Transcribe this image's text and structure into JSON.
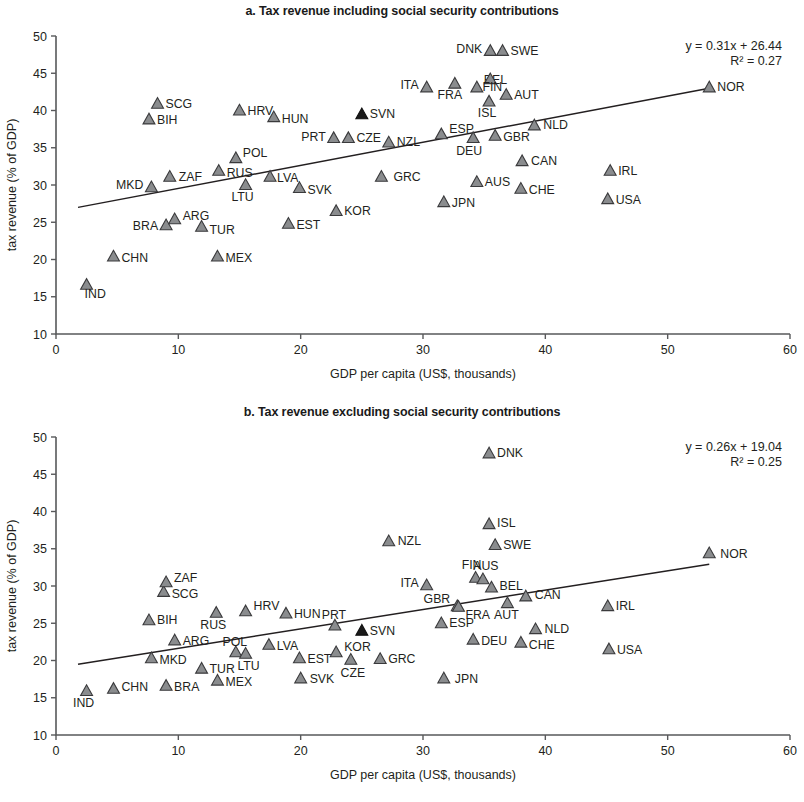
{
  "figure": {
    "width": 804,
    "height": 802,
    "background": "#ffffff",
    "marker_fill": "#8a8c8e",
    "marker_stroke": "#3a3a3c",
    "highlight_fill": "#1a1a1a",
    "axis_color": "#58595b",
    "trend_color": "#231f20"
  },
  "chart_data": [
    {
      "type": "scatter",
      "panel": "a",
      "title": "a. Tax revenue including social security contributions",
      "xlabel": "GDP per capita (US$, thousands)",
      "ylabel": "tax revenue (% of GDP)",
      "xlim": [
        0,
        60
      ],
      "ylim": [
        10,
        50
      ],
      "xticks": [
        0,
        10,
        20,
        30,
        40,
        50,
        60
      ],
      "yticks": [
        10,
        15,
        20,
        25,
        30,
        35,
        40,
        45,
        50
      ],
      "grid": false,
      "legend": "none",
      "annotations": {
        "equation": "y = 0.31x + 26.44",
        "r2": "R² = 0.27"
      },
      "trendline": {
        "slope": 0.31,
        "intercept": 26.44,
        "x_start": 1.8,
        "x_end": 53.4
      },
      "points": [
        {
          "label": "IND",
          "x": 2.5,
          "y": 16.6,
          "lx": -2,
          "ly": 13,
          "anchor": "start",
          "highlight": false
        },
        {
          "label": "CHN",
          "x": 4.7,
          "y": 20.4,
          "lx": 8,
          "ly": 5,
          "anchor": "start",
          "highlight": false
        },
        {
          "label": "BIH",
          "x": 7.6,
          "y": 38.8,
          "lx": 8,
          "ly": 5,
          "anchor": "start",
          "highlight": false
        },
        {
          "label": "SCG",
          "x": 8.3,
          "y": 40.9,
          "lx": 8,
          "ly": 4,
          "anchor": "start",
          "highlight": false
        },
        {
          "label": "MKD",
          "x": 7.8,
          "y": 29.7,
          "lx": -8,
          "ly": 2,
          "anchor": "end",
          "highlight": false
        },
        {
          "label": "BRA",
          "x": 9.0,
          "y": 24.6,
          "lx": -8,
          "ly": 5,
          "anchor": "end",
          "highlight": false
        },
        {
          "label": "ZAF",
          "x": 9.3,
          "y": 31.1,
          "lx": 9,
          "ly": 4,
          "anchor": "start",
          "highlight": false
        },
        {
          "label": "ARG",
          "x": 9.7,
          "y": 25.4,
          "lx": 8,
          "ly": 1,
          "anchor": "start",
          "highlight": false
        },
        {
          "label": "TUR",
          "x": 11.9,
          "y": 24.4,
          "lx": 8,
          "ly": 7,
          "anchor": "start",
          "highlight": false
        },
        {
          "label": "MEX",
          "x": 13.2,
          "y": 20.4,
          "lx": 8,
          "ly": 5,
          "anchor": "start",
          "highlight": false
        },
        {
          "label": "RUS",
          "x": 13.3,
          "y": 31.9,
          "lx": 8,
          "ly": 6,
          "anchor": "start",
          "highlight": false
        },
        {
          "label": "POL",
          "x": 14.7,
          "y": 33.6,
          "lx": 7,
          "ly": -1,
          "anchor": "start",
          "highlight": false
        },
        {
          "label": "LTU",
          "x": 15.5,
          "y": 30.0,
          "lx": -3,
          "ly": 16,
          "anchor": "middle",
          "highlight": false
        },
        {
          "label": "HRV",
          "x": 15.0,
          "y": 40.0,
          "lx": 8,
          "ly": 4,
          "anchor": "start",
          "highlight": false
        },
        {
          "label": "LVA",
          "x": 17.5,
          "y": 31.1,
          "lx": 7,
          "ly": 5,
          "anchor": "start",
          "highlight": false
        },
        {
          "label": "HUN",
          "x": 17.8,
          "y": 39.1,
          "lx": 8,
          "ly": 6,
          "anchor": "start",
          "highlight": false
        },
        {
          "label": "EST",
          "x": 19.0,
          "y": 24.8,
          "lx": 8,
          "ly": 5,
          "anchor": "start",
          "highlight": false
        },
        {
          "label": "SVK",
          "x": 19.9,
          "y": 29.6,
          "lx": 8,
          "ly": 6,
          "anchor": "start",
          "highlight": false
        },
        {
          "label": "PRT",
          "x": 22.7,
          "y": 36.3,
          "lx": -8,
          "ly": 3,
          "anchor": "end",
          "highlight": false
        },
        {
          "label": "CZE",
          "x": 23.9,
          "y": 36.3,
          "lx": 8,
          "ly": 4,
          "anchor": "start",
          "highlight": false
        },
        {
          "label": "KOR",
          "x": 22.9,
          "y": 26.5,
          "lx": 8,
          "ly": 4,
          "anchor": "start",
          "highlight": false
        },
        {
          "label": "SVN",
          "x": 25.0,
          "y": 39.5,
          "lx": 8,
          "ly": 4,
          "anchor": "start",
          "highlight": true
        },
        {
          "label": "GRC",
          "x": 26.6,
          "y": 31.1,
          "lx": 12,
          "ly": 4,
          "anchor": "start",
          "highlight": false
        },
        {
          "label": "NZL",
          "x": 27.2,
          "y": 35.7,
          "lx": 8,
          "ly": 3,
          "anchor": "start",
          "highlight": false
        },
        {
          "label": "ITA",
          "x": 30.3,
          "y": 43.1,
          "lx": -8,
          "ly": 2,
          "anchor": "end",
          "highlight": false
        },
        {
          "label": "ESP",
          "x": 31.5,
          "y": 36.8,
          "lx": 8,
          "ly": -1,
          "anchor": "start",
          "highlight": false
        },
        {
          "label": "JPN",
          "x": 31.7,
          "y": 27.7,
          "lx": 8,
          "ly": 5,
          "anchor": "start",
          "highlight": false
        },
        {
          "label": "FRA",
          "x": 32.6,
          "y": 43.6,
          "lx": -5,
          "ly": 15,
          "anchor": "middle",
          "highlight": false
        },
        {
          "label": "DEU",
          "x": 34.1,
          "y": 36.3,
          "lx": -4,
          "ly": 17,
          "anchor": "middle",
          "highlight": false
        },
        {
          "label": "AUS",
          "x": 34.4,
          "y": 30.4,
          "lx": 8,
          "ly": 4,
          "anchor": "start",
          "highlight": false
        },
        {
          "label": "BEL",
          "x": 34.4,
          "y": 43.1,
          "lx": 7,
          "ly": -3,
          "anchor": "start",
          "highlight": false
        },
        {
          "label": "DNK",
          "x": 35.5,
          "y": 48.0,
          "lx": -8,
          "ly": 2,
          "anchor": "end",
          "highlight": false
        },
        {
          "label": "FIN",
          "x": 35.5,
          "y": 44.2,
          "lx": 2,
          "ly": 12,
          "anchor": "middle",
          "highlight": false
        },
        {
          "label": "ISL",
          "x": 35.4,
          "y": 41.2,
          "lx": -2,
          "ly": 15,
          "anchor": "middle",
          "highlight": false
        },
        {
          "label": "GBR",
          "x": 35.9,
          "y": 36.6,
          "lx": 8,
          "ly": 5,
          "anchor": "start",
          "highlight": false
        },
        {
          "label": "SWE",
          "x": 36.5,
          "y": 48.0,
          "lx": 8,
          "ly": 4,
          "anchor": "start",
          "highlight": false
        },
        {
          "label": "AUT",
          "x": 36.8,
          "y": 42.1,
          "lx": 8,
          "ly": 4,
          "anchor": "start",
          "highlight": false
        },
        {
          "label": "CHE",
          "x": 38.0,
          "y": 29.5,
          "lx": 8,
          "ly": 5,
          "anchor": "start",
          "highlight": false
        },
        {
          "label": "CAN",
          "x": 38.1,
          "y": 33.2,
          "lx": 9,
          "ly": 4,
          "anchor": "start",
          "highlight": false
        },
        {
          "label": "NLD",
          "x": 39.1,
          "y": 38.0,
          "lx": 9,
          "ly": 4,
          "anchor": "start",
          "highlight": false
        },
        {
          "label": "USA",
          "x": 45.1,
          "y": 28.1,
          "lx": 8,
          "ly": 5,
          "anchor": "start",
          "highlight": false
        },
        {
          "label": "IRL",
          "x": 45.3,
          "y": 31.9,
          "lx": 8,
          "ly": 4,
          "anchor": "start",
          "highlight": false
        },
        {
          "label": "NOR",
          "x": 53.4,
          "y": 43.1,
          "lx": 8,
          "ly": 4,
          "anchor": "start",
          "highlight": false
        }
      ]
    },
    {
      "type": "scatter",
      "panel": "b",
      "title": "b. Tax revenue excluding social security contributions",
      "xlabel": "GDP per capita (US$, thousands)",
      "ylabel": "tax revenue (% of GDP)",
      "xlim": [
        0,
        60
      ],
      "ylim": [
        10,
        50
      ],
      "xticks": [
        0,
        10,
        20,
        30,
        40,
        50,
        60
      ],
      "yticks": [
        10,
        15,
        20,
        25,
        30,
        35,
        40,
        45,
        50
      ],
      "grid": false,
      "legend": "none",
      "annotations": {
        "equation": "y = 0.26x + 19.04",
        "r2": "R² = 0.25"
      },
      "trendline": {
        "slope": 0.26,
        "intercept": 19.04,
        "x_start": 1.8,
        "x_end": 53.4
      },
      "points": [
        {
          "label": "IND",
          "x": 2.5,
          "y": 15.9,
          "lx": -3,
          "ly": 16,
          "anchor": "middle",
          "highlight": false
        },
        {
          "label": "CHN",
          "x": 4.7,
          "y": 16.2,
          "lx": 8,
          "ly": 2,
          "anchor": "start",
          "highlight": false
        },
        {
          "label": "BRA",
          "x": 9.0,
          "y": 16.6,
          "lx": 8,
          "ly": 5,
          "anchor": "start",
          "highlight": false
        },
        {
          "label": "MKD",
          "x": 7.8,
          "y": 20.3,
          "lx": 8,
          "ly": 6,
          "anchor": "start",
          "highlight": false
        },
        {
          "label": "BIH",
          "x": 7.6,
          "y": 25.4,
          "lx": 8,
          "ly": 4,
          "anchor": "start",
          "highlight": false
        },
        {
          "label": "SCG",
          "x": 8.8,
          "y": 29.2,
          "lx": 8,
          "ly": 6,
          "anchor": "start",
          "highlight": false
        },
        {
          "label": "ZAF",
          "x": 9.0,
          "y": 30.5,
          "lx": 8,
          "ly": 0,
          "anchor": "start",
          "highlight": false
        },
        {
          "label": "ARG",
          "x": 9.7,
          "y": 22.7,
          "lx": 8,
          "ly": 5,
          "anchor": "start",
          "highlight": false
        },
        {
          "label": "TUR",
          "x": 11.9,
          "y": 18.9,
          "lx": 8,
          "ly": 4,
          "anchor": "start",
          "highlight": false
        },
        {
          "label": "RUS",
          "x": 13.1,
          "y": 26.4,
          "lx": -3,
          "ly": 16,
          "anchor": "middle",
          "highlight": false
        },
        {
          "label": "MEX",
          "x": 13.2,
          "y": 17.3,
          "lx": 8,
          "ly": 5,
          "anchor": "start",
          "highlight": false
        },
        {
          "label": "POL",
          "x": 14.7,
          "y": 21.1,
          "lx": -1,
          "ly": -6,
          "anchor": "middle",
          "highlight": false
        },
        {
          "label": "LTU",
          "x": 15.5,
          "y": 20.9,
          "lx": 3,
          "ly": 16,
          "anchor": "middle",
          "highlight": false
        },
        {
          "label": "HRV",
          "x": 15.5,
          "y": 26.6,
          "lx": 8,
          "ly": -1,
          "anchor": "start",
          "highlight": false
        },
        {
          "label": "LVA",
          "x": 17.4,
          "y": 22.1,
          "lx": 8,
          "ly": 5,
          "anchor": "start",
          "highlight": false
        },
        {
          "label": "HUN",
          "x": 18.8,
          "y": 26.3,
          "lx": 8,
          "ly": 4,
          "anchor": "start",
          "highlight": false
        },
        {
          "label": "EST",
          "x": 19.9,
          "y": 20.3,
          "lx": 8,
          "ly": 5,
          "anchor": "start",
          "highlight": false
        },
        {
          "label": "SVK",
          "x": 20.0,
          "y": 17.6,
          "lx": 9,
          "ly": 5,
          "anchor": "start",
          "highlight": false
        },
        {
          "label": "PRT",
          "x": 22.8,
          "y": 24.7,
          "lx": -1,
          "ly": -6,
          "anchor": "middle",
          "highlight": false
        },
        {
          "label": "KOR",
          "x": 22.9,
          "y": 21.1,
          "lx": 8,
          "ly": -1,
          "anchor": "start",
          "highlight": false
        },
        {
          "label": "CZE",
          "x": 24.1,
          "y": 20.1,
          "lx": 2,
          "ly": 17,
          "anchor": "middle",
          "highlight": false
        },
        {
          "label": "SVN",
          "x": 25.0,
          "y": 24.0,
          "lx": 8,
          "ly": 4,
          "anchor": "start",
          "highlight": true
        },
        {
          "label": "GRC",
          "x": 26.5,
          "y": 20.2,
          "lx": 8,
          "ly": 4,
          "anchor": "start",
          "highlight": false
        },
        {
          "label": "NZL",
          "x": 27.2,
          "y": 36.0,
          "lx": 9,
          "ly": 4,
          "anchor": "start",
          "highlight": false
        },
        {
          "label": "ITA",
          "x": 30.3,
          "y": 30.1,
          "lx": -8,
          "ly": 2,
          "anchor": "end",
          "highlight": false
        },
        {
          "label": "JPN",
          "x": 31.7,
          "y": 17.6,
          "lx": 11,
          "ly": 5,
          "anchor": "start",
          "highlight": false
        },
        {
          "label": "ESP",
          "x": 31.5,
          "y": 25.0,
          "lx": 8,
          "ly": 4,
          "anchor": "start",
          "highlight": false
        },
        {
          "label": "GBR",
          "x": 32.8,
          "y": 27.3,
          "lx": -7,
          "ly": -3,
          "anchor": "end",
          "highlight": false
        },
        {
          "label": "FRA",
          "x": 32.9,
          "y": 27.2,
          "lx": 7,
          "ly": 12,
          "anchor": "start",
          "highlight": false
        },
        {
          "label": "FIN",
          "x": 34.3,
          "y": 31.1,
          "lx": -4,
          "ly": -9,
          "anchor": "middle",
          "highlight": false
        },
        {
          "label": "DEU",
          "x": 34.1,
          "y": 22.8,
          "lx": 8,
          "ly": 5,
          "anchor": "start",
          "highlight": false
        },
        {
          "label": "AUS",
          "x": 34.9,
          "y": 30.9,
          "lx": 3,
          "ly": -9,
          "anchor": "middle",
          "highlight": false
        },
        {
          "label": "BEL",
          "x": 35.6,
          "y": 29.8,
          "lx": 8,
          "ly": 3,
          "anchor": "start",
          "highlight": false
        },
        {
          "label": "DNK",
          "x": 35.4,
          "y": 47.8,
          "lx": 8,
          "ly": 4,
          "anchor": "start",
          "highlight": false
        },
        {
          "label": "ISL",
          "x": 35.4,
          "y": 38.3,
          "lx": 8,
          "ly": 3,
          "anchor": "start",
          "highlight": false
        },
        {
          "label": "SWE",
          "x": 35.9,
          "y": 35.5,
          "lx": 8,
          "ly": 4,
          "anchor": "start",
          "highlight": false
        },
        {
          "label": "AUT",
          "x": 36.9,
          "y": 27.7,
          "lx": -1,
          "ly": 16,
          "anchor": "middle",
          "highlight": false
        },
        {
          "label": "CHE",
          "x": 38.0,
          "y": 22.4,
          "lx": 8,
          "ly": 6,
          "anchor": "start",
          "highlight": false
        },
        {
          "label": "CAN",
          "x": 38.4,
          "y": 28.6,
          "lx": 9,
          "ly": 3,
          "anchor": "start",
          "highlight": false
        },
        {
          "label": "NLD",
          "x": 39.2,
          "y": 24.2,
          "lx": 9,
          "ly": 4,
          "anchor": "start",
          "highlight": false
        },
        {
          "label": "USA",
          "x": 45.2,
          "y": 21.5,
          "lx": 8,
          "ly": 5,
          "anchor": "start",
          "highlight": false
        },
        {
          "label": "IRL",
          "x": 45.1,
          "y": 27.3,
          "lx": 8,
          "ly": 4,
          "anchor": "start",
          "highlight": false
        },
        {
          "label": "NOR",
          "x": 53.4,
          "y": 34.4,
          "lx": 11,
          "ly": 5,
          "anchor": "start",
          "highlight": false
        }
      ]
    }
  ]
}
